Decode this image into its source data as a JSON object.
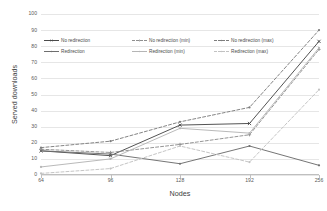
{
  "chart_data": {
    "type": "line",
    "title": "",
    "xlabel": "Nodes",
    "ylabel": "Served downloads",
    "categories": [
      "64",
      "96",
      "128",
      "192",
      "256"
    ],
    "x": [
      64,
      96,
      128,
      192,
      256
    ],
    "xtick_labels": [
      "64",
      "96",
      "128",
      "192",
      "256"
    ],
    "ytick_labels": [
      "0",
      "10",
      "20",
      "30",
      "40",
      "50",
      "60",
      "70",
      "80",
      "90",
      "100"
    ],
    "yticks": [
      0,
      10,
      20,
      30,
      40,
      50,
      60,
      70,
      80,
      90,
      100
    ],
    "ylim": [
      0,
      100
    ],
    "grid": true,
    "grid_axis": "y",
    "legend_position": "upper-left-inside",
    "series": [
      {
        "name": "No redirection",
        "values": [
          15,
          12,
          31,
          32,
          83
        ],
        "style": "solid",
        "color": "#4a4a4a",
        "marker": "cross"
      },
      {
        "name": "No redirection (min)",
        "values": [
          16,
          14,
          19,
          25,
          78
        ],
        "style": "dashed",
        "color": "#8f8f8f",
        "marker": "plus"
      },
      {
        "name": "No redirection (max)",
        "values": [
          17,
          21,
          33,
          42,
          90
        ],
        "style": "dashed",
        "color": "#7d7d7d",
        "marker": "dot"
      },
      {
        "name": "Redirection",
        "values": [
          15,
          13,
          7,
          18,
          6
        ],
        "style": "solid",
        "color": "#6e6e6e",
        "marker": "dot"
      },
      {
        "name": "Redirection (min)",
        "values": [
          5,
          10,
          29,
          26,
          79
        ],
        "style": "solid",
        "color": "#b5b5b5",
        "marker": "dot"
      },
      {
        "name": "Redirection (max)",
        "values": [
          1,
          4,
          18,
          8,
          53
        ],
        "style": "dashed",
        "color": "#c2c2c2",
        "marker": "dot"
      }
    ]
  },
  "axes": {
    "x_title": "Nodes",
    "y_title": "Served downloads"
  },
  "colors": {
    "grid": "#e6e6e6",
    "axis": "#bfbfbf",
    "tick_text": "#595959",
    "title_text": "#404040",
    "background": "#ffffff"
  }
}
